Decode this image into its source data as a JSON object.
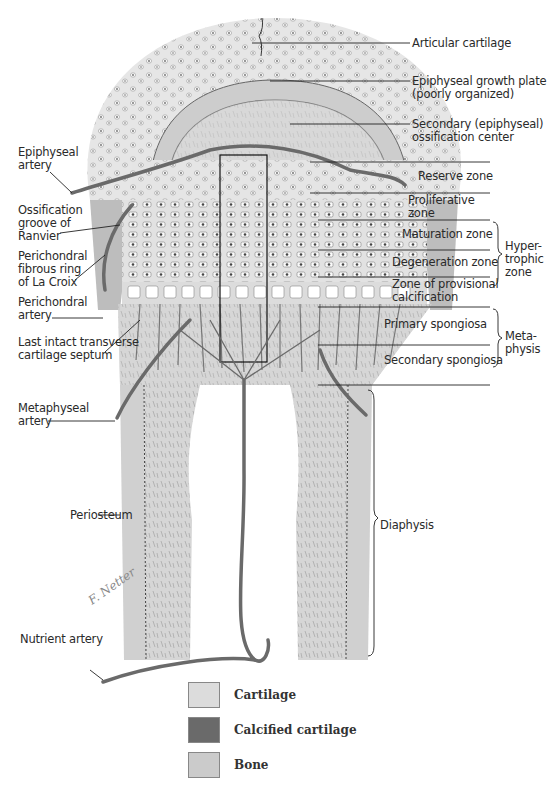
{
  "figure": {
    "colors": {
      "cartilage": "#e4e4e4",
      "calcified_cartilage": "#6e6e6e",
      "bone": "#cfcfcf",
      "artery": "#6a6a6a",
      "line": "#222222"
    }
  },
  "labels_right": {
    "articular_cartilage": "Articular cartilage",
    "epiphyseal_growth_plate": "Epiphyseal growth plate\n(poorly organized)",
    "secondary_ossification_center": "Secondary (epiphyseal)\nossification center",
    "reserve_zone": "Reserve zone",
    "proliferative_zone": "Proliferative\nzone",
    "maturation_zone": "Maturation zone",
    "degeneration_zone": "Degeneration zone",
    "provisional_calcification": "Zone of provisional\ncalcification",
    "hypertrophic_zone": "Hyper-\ntrophic\nzone",
    "primary_spongiosa": "Primary spongiosa",
    "secondary_spongiosa": "Secondary spongiosa",
    "metaphysis": "Meta-\nphysis",
    "diaphysis": "Diaphysis"
  },
  "labels_left": {
    "epiphyseal_artery": "Epiphyseal\nartery",
    "ossification_groove": "Ossification\ngroove of\nRanvier",
    "perichondral_ring": "Perichondral\nfibrous ring\nof La Croix",
    "perichondral_artery": "Perichondral\nartery",
    "last_septum": "Last intact transverse\ncartilage septum",
    "metaphyseal_artery": "Metaphyseal\nartery",
    "periosteum": "Periosteum",
    "nutrient_artery": "Nutrient artery"
  },
  "signature": "F. Netter",
  "legend": [
    {
      "label": "Cartilage",
      "color": "#dcdcdc"
    },
    {
      "label": "Calcified cartilage",
      "color": "#6a6a6a"
    },
    {
      "label": "Bone",
      "color": "#cbcbcb"
    }
  ]
}
